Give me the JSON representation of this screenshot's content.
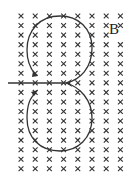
{
  "diagram": {
    "field_label": "B",
    "field_direction_symbol": "×",
    "field_direction": "into-page",
    "grid": {
      "columns": 8,
      "rows": 17,
      "x_start": 21,
      "x_step": 14.2,
      "y_start": 16,
      "y_step": 9.55
    },
    "colors": {
      "cross": "#333333",
      "path": "#333333",
      "background": "#ffffff"
    },
    "label_position": {
      "x": 109,
      "y": 30
    }
  }
}
